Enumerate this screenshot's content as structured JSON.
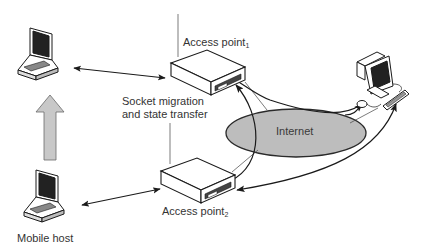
{
  "diagram": {
    "type": "network-mobility",
    "labels": {
      "access_point_1": "Access point",
      "access_point_1_sub": "1",
      "access_point_2": "Access point",
      "access_point_2_sub": "2",
      "socket_migration_line1": "Socket migration",
      "socket_migration_line2": "and state transfer",
      "internet": "Internet",
      "mobile_host": "Mobile host"
    },
    "nodes": [
      {
        "id": "laptop-top",
        "kind": "laptop"
      },
      {
        "id": "laptop-bottom",
        "kind": "laptop",
        "label": "Mobile host"
      },
      {
        "id": "ap1",
        "kind": "access-point",
        "label": "Access point 1"
      },
      {
        "id": "ap2",
        "kind": "access-point",
        "label": "Access point 2"
      },
      {
        "id": "internet",
        "kind": "cloud-ellipse",
        "label": "Internet"
      },
      {
        "id": "desktop",
        "kind": "desktop-computer"
      }
    ],
    "edges": [
      {
        "from": "laptop-top",
        "to": "ap1",
        "style": "double-arrow"
      },
      {
        "from": "laptop-bottom",
        "to": "ap2",
        "style": "double-arrow"
      },
      {
        "from": "laptop-bottom",
        "to": "laptop-top",
        "style": "gray-block-arrow",
        "meaning": "host moves"
      },
      {
        "from": "ap1",
        "to": "ap2",
        "style": "thin-line",
        "meaning": "socket migration and state transfer"
      },
      {
        "from": "internet",
        "to": "ap1",
        "style": "curved-arrow"
      },
      {
        "from": "internet",
        "to": "desktop",
        "style": "curved-arrow"
      },
      {
        "from": "ap2",
        "to": "ap1",
        "style": "curved-arrow"
      },
      {
        "from": "desktop",
        "to": "ap2",
        "style": "curved-double-arrow"
      }
    ],
    "colors": {
      "line": "#1a1a1a",
      "ellipse_fill": "#bdbdbd",
      "block_arrow_fill": "#c8c8c8",
      "text": "#333333"
    }
  }
}
